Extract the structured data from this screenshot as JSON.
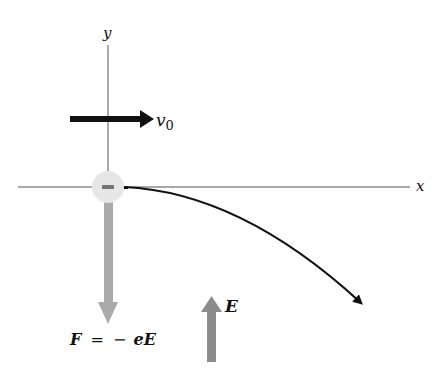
{
  "diagram": {
    "axes": {
      "x_label": "x",
      "y_label": "y",
      "color": "#555555"
    },
    "electron": {
      "charge_symbol": "−",
      "fill": "#e6e6e6",
      "mark_color": "#777777"
    },
    "velocity": {
      "label_main": "v",
      "label_sub": "0",
      "color": "#111111"
    },
    "force": {
      "label": "F = − eE",
      "label_parts": {
        "F": "F",
        "equals": "=",
        "minus": "−",
        "e": "e",
        "E": "E"
      },
      "color": "#aaaaaa"
    },
    "field": {
      "label": "E",
      "color": "#8c8c8c"
    },
    "trajectory": {
      "color": "#111111"
    }
  }
}
